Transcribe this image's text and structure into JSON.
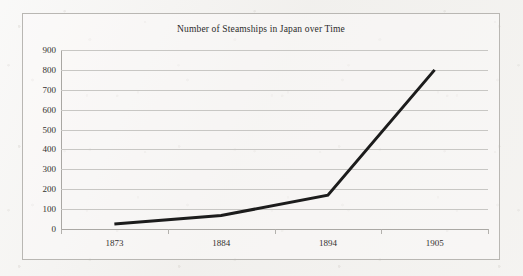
{
  "chart_data": {
    "type": "line",
    "title": "Number of Steamships in Japan over Time",
    "xlabel": "",
    "ylabel": "",
    "categories": [
      "1873",
      "1884",
      "1894",
      "1905"
    ],
    "series": [
      {
        "name": "Steamships",
        "values": [
          25,
          68,
          170,
          800
        ],
        "color": "#1c1c1c",
        "line_width": 3
      }
    ],
    "ylim": [
      0,
      900
    ],
    "y_ticks": [
      "0",
      "100",
      "200",
      "300",
      "400",
      "500",
      "600",
      "700",
      "800",
      "900"
    ],
    "y_tick_values": [
      0,
      100,
      200,
      300,
      400,
      500,
      600,
      700,
      800,
      900
    ],
    "grid": true,
    "grid_color": "#c8c7c4",
    "legend": false,
    "legend_position": "none",
    "plot_background": "#fcfbfa",
    "frame_color": "#b9b7b3",
    "text_color": "#33312f"
  }
}
